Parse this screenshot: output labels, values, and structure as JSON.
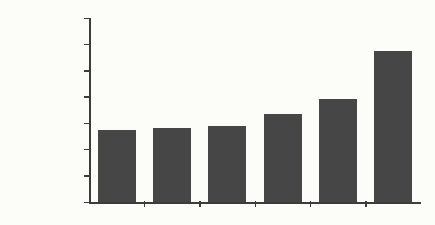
{
  "chart_data": {
    "type": "bar",
    "title": "",
    "xlabel": "",
    "ylabel": "",
    "categories": [
      "Missouri",
      "Texas",
      "Florida",
      "Colorado",
      "Washington",
      "California"
    ],
    "values": [
      55031,
      56582,
      57999,
      66967,
      78287,
      115129
    ],
    "value_labels": [
      "$55,031",
      "$56,582",
      "$57,999",
      "$66,967",
      "$78,287",
      "$115,129"
    ],
    "ylim": [
      0,
      140000
    ],
    "ytick_values": [
      0,
      20000,
      40000,
      60000,
      80000,
      100000,
      120000,
      140000
    ],
    "ytick_labels": [
      "$",
      "$20,000",
      "$40,000",
      "$60,000",
      "$80,000",
      "$100,000",
      "$120,000",
      "$140,000"
    ],
    "grid": false,
    "legend": false,
    "colors": {
      "bar": "#464646",
      "axis": "#3c3c3c",
      "text": "#1c1c1c",
      "background": "#fcfcf9"
    }
  }
}
